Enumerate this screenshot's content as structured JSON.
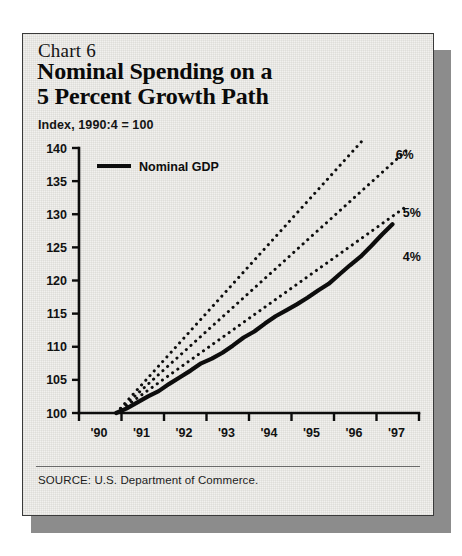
{
  "figure": {
    "chart_number": "Chart 6",
    "title_line_1": "Nominal Spending on a",
    "title_line_2": "5 Percent Growth Path",
    "subtitle": "Index, 1990:4 = 100",
    "source": "SOURCE: U.S. Department of Commerce.",
    "panel_color": "#f2f1ee",
    "shadow_color": "#8c8c8c",
    "ink_color": "#0d0d0d"
  },
  "legend": {
    "position": "top-left-inside-plot",
    "entries": [
      {
        "label": "Nominal GDP",
        "style": "solid",
        "color": "#0d0d0d",
        "width": 4
      }
    ]
  },
  "chart_data": {
    "type": "line",
    "title": "Nominal Spending on a 5 Percent Growth Path",
    "subtitle": "Index, 1990:4 = 100",
    "xlabel": "",
    "ylabel": "Index, 1990:4 = 100",
    "xlim": [
      1990,
      1998
    ],
    "ylim": [
      100,
      140
    ],
    "yticks": [
      100,
      105,
      110,
      115,
      120,
      125,
      130,
      135,
      140
    ],
    "ytick_labels": [
      "100",
      "105",
      "110",
      "115",
      "120",
      "125",
      "130",
      "135",
      "140"
    ],
    "xticks": [
      1990,
      1991,
      1992,
      1993,
      1994,
      1995,
      1996,
      1997,
      1998
    ],
    "xtick_labels": [
      "'90",
      "'91",
      "'92",
      "'93",
      "'94",
      "'95",
      "'96",
      "'97",
      ""
    ],
    "grid": false,
    "annotations": [
      {
        "text": "6%",
        "x": 1997.45,
        "y": 138.9
      },
      {
        "text": "5%",
        "x": 1997.62,
        "y": 130.2
      },
      {
        "text": "4%",
        "x": 1997.62,
        "y": 123.6
      }
    ],
    "series": [
      {
        "name": "Nominal GDP",
        "style": "solid",
        "color": "#0d0d0d",
        "width": 4.2,
        "x": [
          1990.875,
          1991.125,
          1991.375,
          1991.625,
          1991.875,
          1992.125,
          1992.375,
          1992.625,
          1992.875,
          1993.125,
          1993.375,
          1993.625,
          1993.875,
          1994.125,
          1994.375,
          1994.625,
          1994.875,
          1995.125,
          1995.375,
          1995.625,
          1995.875,
          1996.125,
          1996.375,
          1996.625,
          1996.875,
          1997.125,
          1997.375
        ],
        "y": [
          100.0,
          100.7,
          101.6,
          102.5,
          103.3,
          104.4,
          105.4,
          106.4,
          107.5,
          108.2,
          109.1,
          110.2,
          111.4,
          112.3,
          113.5,
          114.6,
          115.5,
          116.4,
          117.4,
          118.5,
          119.5,
          120.9,
          122.3,
          123.6,
          125.2,
          126.9,
          128.5
        ]
      },
      {
        "name": "6% growth path",
        "style": "dotted",
        "color": "#0d0d0d",
        "width": 2.6,
        "x": [
          1990.875,
          1997.75
        ],
        "y": [
          100.0,
          148.8
        ]
      },
      {
        "name": "5% growth path",
        "style": "dotted",
        "color": "#0d0d0d",
        "width": 2.6,
        "x": [
          1990.875,
          1997.75
        ],
        "y": [
          100.0,
          139.9
        ]
      },
      {
        "name": "4% growth path",
        "style": "dotted",
        "color": "#0d0d0d",
        "width": 2.6,
        "x": [
          1990.875,
          1997.75
        ],
        "y": [
          100.0,
          131.4
        ]
      }
    ]
  }
}
